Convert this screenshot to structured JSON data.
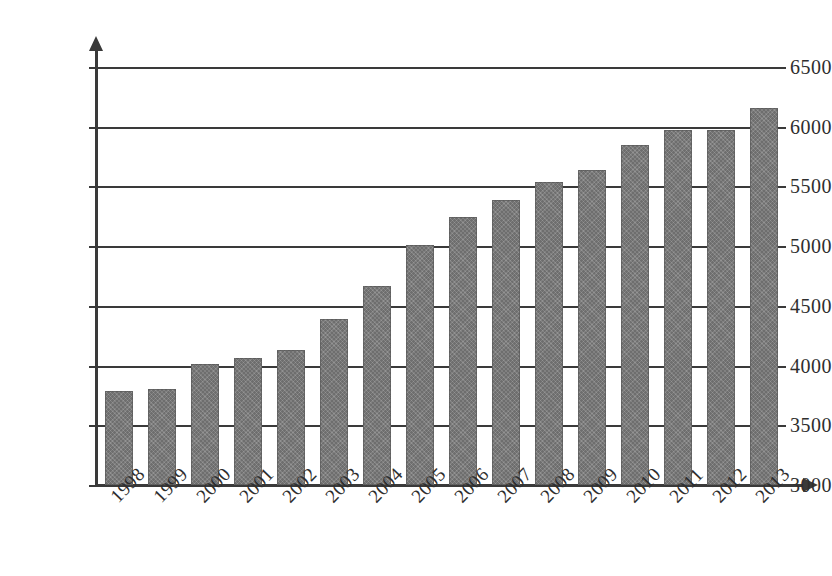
{
  "chart_data": {
    "type": "bar",
    "title": "",
    "subtitle": "",
    "xlabel": "",
    "ylabel": "",
    "categories": [
      "1998",
      "1999",
      "2000",
      "2001",
      "2002",
      "2003",
      "2004",
      "2005",
      "2006",
      "2007",
      "2008",
      "2009",
      "2010",
      "2011",
      "2012",
      "2013"
    ],
    "values": [
      3790,
      3800,
      4010,
      4060,
      4130,
      4390,
      4670,
      5010,
      5240,
      5390,
      5540,
      5640,
      5850,
      5970,
      5970,
      6160
    ],
    "series": [
      {
        "name": "",
        "values": [
          3790,
          3800,
          4010,
          4060,
          4130,
          4390,
          4670,
          5010,
          5240,
          5390,
          5540,
          5640,
          5850,
          5970,
          5970,
          6160
        ]
      }
    ],
    "ylim": [
      3000,
      6500
    ],
    "ytick_values": [
      3000,
      3500,
      4000,
      4500,
      5000,
      5500,
      6000,
      6500
    ],
    "ytick_labels": [
      "3000",
      "3500",
      "4000",
      "4500",
      "5000",
      "5500",
      "6000",
      "6500"
    ],
    "grid": true,
    "grid_axis": "y",
    "legend": false,
    "legend_position": "none",
    "annotations": [],
    "bar_color": "#7b7b7b",
    "axis_color": "#3a3a3a",
    "xtick_rotation": -46
  }
}
